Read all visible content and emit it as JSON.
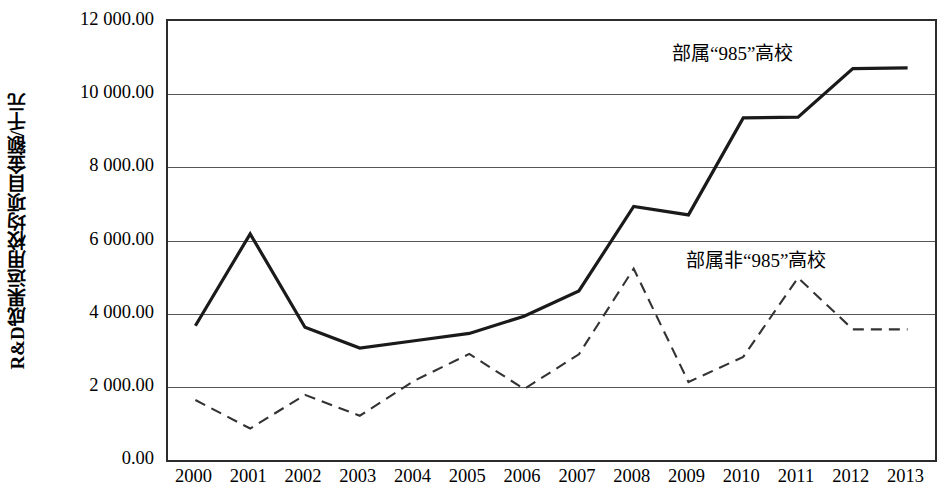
{
  "chart_data": {
    "type": "line",
    "title": "",
    "xlabel": "",
    "ylabel": "R&D成果运用校均项目金额/千元",
    "categories": [
      "2000",
      "2001",
      "2002",
      "2003",
      "2004",
      "2005",
      "2006",
      "2007",
      "2008",
      "2009",
      "2010",
      "2011",
      "2012",
      "2013"
    ],
    "ylim": [
      0,
      12000
    ],
    "ytick_values": [
      0,
      2000,
      4000,
      6000,
      8000,
      10000,
      12000
    ],
    "ytick_labels": [
      "0.00",
      "2 000.00",
      "4 000.00",
      "6 000.00",
      "8 000.00",
      "10 000.00",
      "12 000.00"
    ],
    "grid": true,
    "legend_position": "inline-annotation",
    "series": [
      {
        "name": "部属“985”高校",
        "style": "solid",
        "color": "#1a1a1a",
        "width": 3.2,
        "values": [
          3670,
          6180,
          3630,
          3060,
          3260,
          3460,
          3930,
          4620,
          6930,
          6700,
          9350,
          9370,
          10700,
          10720
        ]
      },
      {
        "name": "部属非“985”高校",
        "style": "dashed",
        "color": "#333333",
        "width": 2.1,
        "values": [
          1640,
          860,
          1780,
          1210,
          2170,
          2900,
          1940,
          2890,
          5230,
          2130,
          2820,
          4980,
          3570,
          3570
        ]
      }
    ],
    "annotations": [
      {
        "text": "部属“985”高校",
        "series": "部属“985”高校"
      },
      {
        "text": "部属非“985”高校",
        "series": "部属非“985”高校"
      }
    ]
  }
}
